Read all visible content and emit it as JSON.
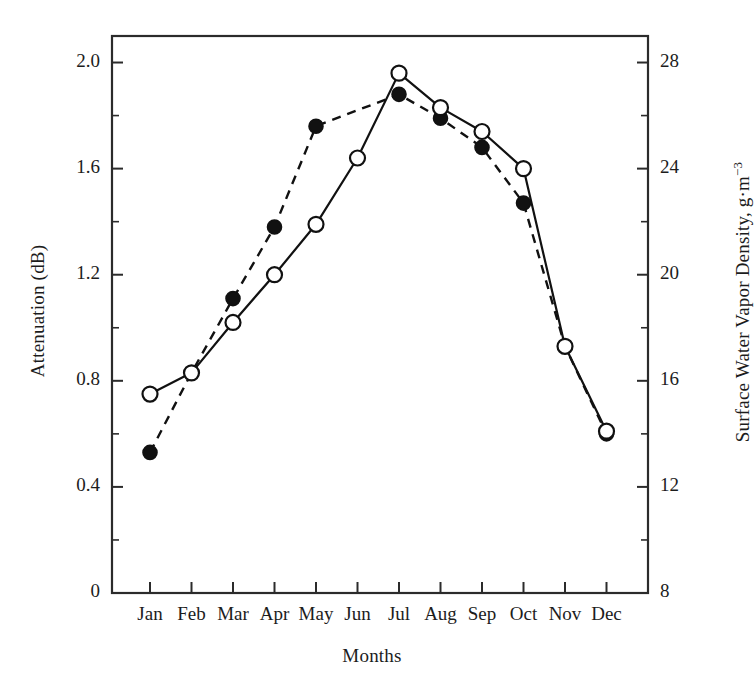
{
  "chart_data": {
    "type": "line",
    "title": "",
    "xlabel": "Months",
    "ylabel": "Attenuation (dB)",
    "y2label": "Surface Water Vapor Density, g·m",
    "y2label_superscript": "−3",
    "categories": [
      "Jan",
      "Feb",
      "Mar",
      "Apr",
      "May",
      "Jun",
      "Jul",
      "Aug",
      "Sep",
      "Oct",
      "Nov",
      "Dec"
    ],
    "ylim": [
      0,
      2.1
    ],
    "yticks": [
      "0",
      "0.4",
      "0.8",
      "1.2",
      "1.6",
      "2.0"
    ],
    "ytick_values": [
      0,
      0.4,
      0.8,
      1.2,
      1.6,
      2.0
    ],
    "yminor_values": [
      0.2,
      0.6,
      1.0,
      1.4,
      1.8
    ],
    "y2lim": [
      8,
      29
    ],
    "y2ticks": [
      "8",
      "12",
      "16",
      "20",
      "24",
      "28"
    ],
    "y2tick_values": [
      8,
      12,
      16,
      20,
      24,
      28
    ],
    "y2minor_values": [
      10,
      14,
      18,
      22,
      26
    ],
    "grid": false,
    "legend": "none",
    "series": [
      {
        "name": "Attenuation (dB)",
        "axis": "left",
        "linestyle": "solid",
        "marker": "open-circle",
        "color": "#111111",
        "values": [
          0.75,
          0.83,
          1.02,
          1.2,
          1.39,
          1.64,
          1.96,
          1.83,
          1.74,
          1.6,
          0.93,
          0.61
        ]
      },
      {
        "name": "Surface Water Vapor Density, g·m−3",
        "axis": "right",
        "linestyle": "dashed",
        "marker": "filled-circle",
        "color": "#111111",
        "values": [
          13.4,
          16.2,
          18.9,
          21.7,
          25.4,
          null,
          26.6,
          25.9,
          24.5,
          22.7,
          17.1,
          14.0
        ],
        "values_left_axis_equivalent": [
          0.53,
          0.83,
          1.11,
          1.38,
          1.76,
          null,
          1.88,
          1.79,
          1.68,
          1.47,
          0.93,
          0.6
        ]
      }
    ]
  },
  "figure": {
    "background": "#ffffff",
    "axis_color": "#2b2b2b",
    "ink_color": "#111111"
  }
}
